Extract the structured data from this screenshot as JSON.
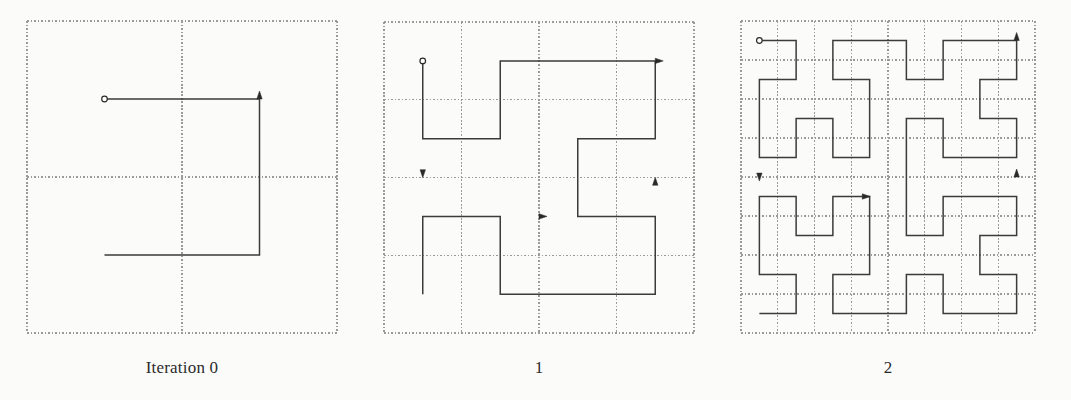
{
  "figure": {
    "title_visible": false,
    "background_color": "#fbfbfa",
    "curve_color": "#3b3b3b",
    "grid_color": "#9a9a9a",
    "marker_color": "#2a2a2a",
    "width": 1071,
    "height": 400
  },
  "panels": [
    {
      "id": "iteration-0",
      "caption": "Iteration 0",
      "caption_x": 182,
      "caption_y": 368,
      "order": 1,
      "grid_divisions": 2,
      "box": {
        "x": 27,
        "y": 21,
        "w": 310,
        "h": 312
      },
      "start_marker": {
        "cell_x": 0.5,
        "cell_y": 0.5,
        "type": "circle"
      },
      "end_marker": {
        "cell_x": 1.5,
        "cell_y": 0.5,
        "type": "arrow",
        "direction": "up"
      },
      "mid_arrows": [],
      "path_cells": [
        [
          0,
          0
        ],
        [
          0,
          1
        ],
        [
          1,
          1
        ],
        [
          1,
          0
        ]
      ]
    },
    {
      "id": "iteration-1",
      "caption": "1",
      "caption_x": 539,
      "caption_y": 368,
      "order": 2,
      "grid_divisions": 4,
      "box": {
        "x": 384,
        "y": 22,
        "w": 310,
        "h": 311
      },
      "start_marker": {
        "cell_x": 0.5,
        "cell_y": 0.5,
        "type": "circle"
      },
      "end_marker": {
        "cell_x": 3.5,
        "cell_y": 0.5,
        "type": "arrow",
        "direction": "right"
      },
      "mid_arrows": [
        {
          "cell_x": 0.5,
          "cell_y": 1.9,
          "direction": "down"
        },
        {
          "cell_x": 3.5,
          "cell_y": 2.1,
          "direction": "up"
        },
        {
          "cell_x": 2.0,
          "cell_y": 2.5,
          "direction": "right"
        }
      ],
      "path_cells": [
        [
          0,
          0
        ],
        [
          1,
          0
        ],
        [
          1,
          1
        ],
        [
          0,
          1
        ],
        [
          0,
          2
        ],
        [
          0,
          3
        ],
        [
          1,
          3
        ],
        [
          1,
          2
        ],
        [
          2,
          2
        ],
        [
          2,
          3
        ],
        [
          3,
          3
        ],
        [
          3,
          2
        ],
        [
          3,
          1
        ],
        [
          2,
          1
        ],
        [
          2,
          0
        ],
        [
          3,
          0
        ]
      ]
    },
    {
      "id": "iteration-2",
      "caption": "2",
      "caption_x": 888,
      "caption_y": 368,
      "order": 3,
      "grid_divisions": 8,
      "box": {
        "x": 741,
        "y": 21,
        "w": 294,
        "h": 312
      },
      "start_marker": {
        "cell_x": 0.5,
        "cell_y": 0.5,
        "type": "circle"
      },
      "end_marker": {
        "cell_x": 7.5,
        "cell_y": 0.5,
        "type": "arrow",
        "direction": "up"
      },
      "mid_arrows": [
        {
          "cell_x": 0.5,
          "cell_y": 3.9,
          "direction": "down"
        },
        {
          "cell_x": 7.5,
          "cell_y": 4.0,
          "direction": "up"
        },
        {
          "cell_x": 3.3,
          "cell_y": 4.5,
          "direction": "right"
        }
      ],
      "path_cells": [
        [
          0,
          0
        ],
        [
          0,
          1
        ],
        [
          1,
          1
        ],
        [
          1,
          0
        ],
        [
          2,
          0
        ],
        [
          3,
          0
        ],
        [
          3,
          1
        ],
        [
          2,
          1
        ],
        [
          2,
          2
        ],
        [
          3,
          2
        ],
        [
          3,
          3
        ],
        [
          2,
          3
        ],
        [
          1,
          3
        ],
        [
          1,
          2
        ],
        [
          0,
          2
        ],
        [
          0,
          3
        ],
        [
          0,
          4
        ],
        [
          1,
          4
        ],
        [
          1,
          5
        ],
        [
          0,
          5
        ],
        [
          0,
          6
        ],
        [
          0,
          7
        ],
        [
          1,
          7
        ],
        [
          1,
          6
        ],
        [
          2,
          6
        ],
        [
          2,
          7
        ],
        [
          3,
          7
        ],
        [
          3,
          6
        ],
        [
          2,
          5
        ],
        [
          2,
          4
        ],
        [
          3,
          4
        ],
        [
          3,
          5
        ],
        [
          4,
          5
        ],
        [
          4,
          4
        ],
        [
          5,
          4
        ],
        [
          5,
          5
        ],
        [
          4,
          6
        ],
        [
          4,
          7
        ],
        [
          5,
          7
        ],
        [
          5,
          6
        ],
        [
          6,
          6
        ],
        [
          6,
          7
        ],
        [
          7,
          7
        ],
        [
          7,
          6
        ],
        [
          7,
          5
        ],
        [
          6,
          5
        ],
        [
          6,
          4
        ],
        [
          7,
          4
        ],
        [
          7,
          3
        ],
        [
          7,
          2
        ],
        [
          6,
          2
        ],
        [
          6,
          3
        ],
        [
          5,
          3
        ],
        [
          4,
          3
        ],
        [
          4,
          2
        ],
        [
          5,
          2
        ],
        [
          5,
          1
        ],
        [
          4,
          1
        ],
        [
          4,
          0
        ],
        [
          5,
          0
        ],
        [
          6,
          0
        ],
        [
          6,
          1
        ],
        [
          7,
          1
        ],
        [
          7,
          0
        ]
      ]
    }
  ],
  "chart_data": {
    "type": "line",
    "xlabel": "",
    "ylabel": "",
    "series": [
      {
        "name": "Iteration 0",
        "order": 1,
        "grid": 2,
        "segments": 3,
        "vertices": [
          [
            0.5,
            0.5
          ],
          [
            0.5,
            1.5
          ],
          [
            1.5,
            1.5
          ],
          [
            1.5,
            0.5
          ]
        ]
      },
      {
        "name": "1",
        "order": 2,
        "grid": 4,
        "segments": 15,
        "vertices": [
          [
            0.5,
            0.5
          ],
          [
            1.5,
            0.5
          ],
          [
            1.5,
            1.5
          ],
          [
            0.5,
            1.5
          ],
          [
            0.5,
            2.5
          ],
          [
            0.5,
            3.5
          ],
          [
            1.5,
            3.5
          ],
          [
            1.5,
            2.5
          ],
          [
            2.5,
            2.5
          ],
          [
            2.5,
            3.5
          ],
          [
            3.5,
            3.5
          ],
          [
            3.5,
            2.5
          ],
          [
            3.5,
            1.5
          ],
          [
            2.5,
            1.5
          ],
          [
            2.5,
            0.5
          ],
          [
            3.5,
            0.5
          ]
        ]
      },
      {
        "name": "2",
        "order": 3,
        "grid": 8,
        "segments": 63,
        "vertices": []
      }
    ],
    "legend_position": "below-each-panel",
    "grid": true
  }
}
